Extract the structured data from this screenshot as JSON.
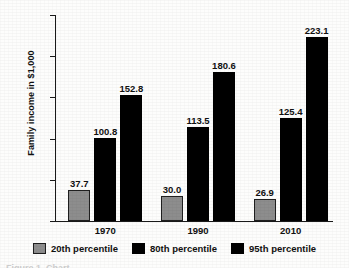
{
  "chart_data": {
    "type": "bar",
    "title": "",
    "xlabel": "",
    "ylabel": "Family income in $1,000",
    "categories": [
      "1970",
      "1990",
      "2010"
    ],
    "ylim": [
      0,
      250
    ],
    "yticks": [
      0,
      50,
      100,
      150,
      200,
      250
    ],
    "ytick_labels": [
      "0",
      "50",
      "100",
      "150",
      "200",
      "$250"
    ],
    "grid": false,
    "legend_position": "bottom",
    "series": [
      {
        "name": "20th percentile",
        "color": "#8d8d8d",
        "values": [
          37.7,
          30.0,
          26.9
        ],
        "labels": [
          "37.7",
          "30.0",
          "26.9"
        ]
      },
      {
        "name": "80th percentile",
        "color": "#000000",
        "values": [
          100.8,
          113.5,
          125.4
        ],
        "labels": [
          "100.8",
          "113.5",
          "125.4"
        ]
      },
      {
        "name": "95th percentile",
        "color": "#000000",
        "values": [
          152.8,
          180.6,
          223.1
        ],
        "labels": [
          "152.8",
          "180.6",
          "223.1"
        ]
      }
    ]
  },
  "caption": {
    "text": "Figure 1.  Chart"
  }
}
